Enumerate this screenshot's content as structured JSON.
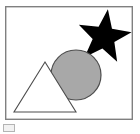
{
  "image": {
    "title": "Geometric shapes figure",
    "width": 140,
    "height": 134,
    "background_color": "#ffffff"
  },
  "frame": {
    "name": "figure-border",
    "x": 5,
    "y": 6,
    "width": 128,
    "height": 114,
    "stroke_color": "#808080",
    "stroke_width": 1.4,
    "fill_color": "#ffffff"
  },
  "corner_marker": {
    "name": "bottom-left-marker",
    "x": 3,
    "y": 124,
    "width": 12,
    "height": 8,
    "stroke_color": "#b4b4b4",
    "fill_color": "#f2f2f2",
    "stroke_width": 1
  },
  "shapes": [
    {
      "id": "star",
      "label": "Star",
      "type": "star",
      "points": 5,
      "fill_color": "#000000",
      "stroke_color": "#000000",
      "stroke_width": 0,
      "center_x": 104,
      "center_y": 37,
      "outer_radius": 28,
      "inner_radius": 11.5,
      "rotation_deg": 8,
      "z_order": 1
    },
    {
      "id": "circle",
      "label": "Circle",
      "type": "circle",
      "fill_color": "#a8a8a8",
      "stroke_color": "#4d4d4d",
      "stroke_width": 1.2,
      "center_x": 76,
      "center_y": 75,
      "radius": 25,
      "z_order": 2
    },
    {
      "id": "triangle",
      "label": "Triangle",
      "type": "triangle",
      "fill_color": "#ffffff",
      "stroke_color": "#4d4d4d",
      "stroke_width": 1.1,
      "apex_x": 45,
      "apex_y": 62,
      "base_left_x": 14,
      "base_left_y": 112,
      "base_right_x": 76,
      "base_right_y": 112,
      "z_order": 3
    }
  ],
  "palette": {
    "black": "#000000",
    "gray_fill": "#a8a8a8",
    "outline_gray": "#4d4d4d",
    "frame_gray": "#808080",
    "white": "#ffffff",
    "marker_gray": "#b4b4b4"
  }
}
